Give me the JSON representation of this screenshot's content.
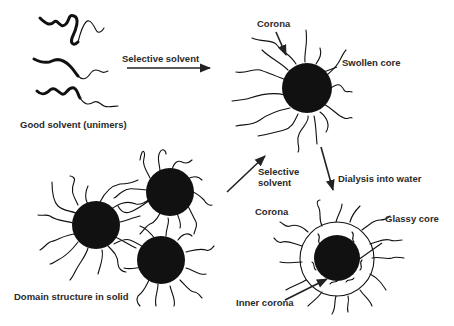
{
  "diagram": {
    "labels": {
      "good_solvent": "Good solvent (unimers)",
      "selective_solvent_top": "Selective solvent",
      "corona_top": "Corona",
      "swollen_core": "Swollen core",
      "selective_solvent_mid_line1": "Selective",
      "selective_solvent_mid_line2": "solvent",
      "dialysis": "Dialysis into water",
      "corona_bottom": "Corona",
      "glassy_core": "Glassy core",
      "inner_corona": "Inner corona",
      "domain_structure": "Domain structure in solid"
    },
    "colors": {
      "core": "#111111",
      "line": "#111111",
      "text": "#2a2a2a",
      "background": "#ffffff"
    },
    "nodes": [
      {
        "id": "unimers",
        "label": "Good solvent (unimers)"
      },
      {
        "id": "swollen-micelle",
        "label": "Swollen core"
      },
      {
        "id": "domain-solid",
        "label": "Domain structure in solid"
      },
      {
        "id": "glassy-micelle",
        "label": "Glassy core"
      }
    ],
    "edges": [
      {
        "from": "unimers",
        "to": "swollen-micelle",
        "label": "Selective solvent"
      },
      {
        "from": "domain-solid",
        "to": "swollen-micelle",
        "label": "Selective solvent"
      },
      {
        "from": "swollen-micelle",
        "to": "glassy-micelle",
        "label": "Dialysis into water"
      }
    ]
  }
}
